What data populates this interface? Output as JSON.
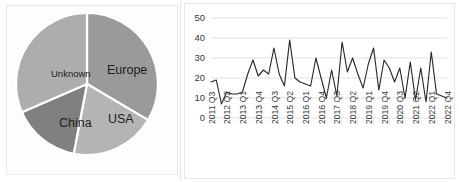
{
  "chart_data": [
    {
      "type": "pie",
      "title": "",
      "legend_position": "none",
      "labels": [
        "Europe",
        "USA",
        "China",
        "Unknown"
      ],
      "values": [
        33.5,
        19.5,
        15.5,
        31.5
      ],
      "colors": [
        "#9a9a9a",
        "#b4b4b4",
        "#808080",
        "#adadad"
      ],
      "start_angle_deg": 0,
      "direction": "clockwise",
      "slices": [
        {
          "label": "Europe",
          "value": 33.5,
          "color": "#9a9a9a",
          "start_deg": 0,
          "end_deg": 120.6
        },
        {
          "label": "USA",
          "value": 19.5,
          "color": "#b4b4b4",
          "start_deg": 120.6,
          "end_deg": 190.8
        },
        {
          "label": "China",
          "value": 15.5,
          "color": "#808080",
          "start_deg": 190.8,
          "end_deg": 246.6
        },
        {
          "label": "Unknown",
          "value": 31.5,
          "color": "#adadad",
          "start_deg": 246.6,
          "end_deg": 360
        }
      ]
    },
    {
      "type": "line",
      "title": "",
      "xlabel": "",
      "ylabel": "",
      "ylim": [
        0,
        50
      ],
      "yticks": [
        0,
        10,
        20,
        30,
        40,
        50
      ],
      "grid": true,
      "legend_position": "none",
      "line_color": "#2b2b2b",
      "x": [
        "2011 Q3",
        "2011 Q4",
        "2012 Q1",
        "2012 Q2",
        "2012 Q3",
        "2012 Q4",
        "2013 Q1",
        "2013 Q2",
        "2013 Q3",
        "2013 Q4",
        "2014 Q1",
        "2014 Q2",
        "2014 Q3",
        "2014 Q4",
        "2015 Q1",
        "2015 Q2",
        "2015 Q3",
        "2015 Q4",
        "2016 Q1",
        "2016 Q2",
        "2016 Q3",
        "2016 Q4",
        "2017 Q1",
        "2017 Q2",
        "2017 Q3",
        "2017 Q4",
        "2018 Q1",
        "2018 Q2",
        "2018 Q3",
        "2018 Q4",
        "2019 Q1",
        "2019 Q2",
        "2019 Q3",
        "2019 Q4",
        "2020 Q1",
        "2020 Q2",
        "2020 Q3",
        "2020 Q4",
        "2021 Q1",
        "2021 Q2",
        "2021 Q3",
        "2021 Q4",
        "2022 Q1",
        "2022 Q2",
        "2022 Q3",
        "2022 Q4"
      ],
      "xtick_labels": [
        "2011 Q3",
        "2012 Q2",
        "2013 Q1",
        "2013 Q4",
        "2014 Q3",
        "2015 Q2",
        "2016 Q1",
        "2016 Q4",
        "2017 Q3",
        "2018 Q2",
        "2019 Q1",
        "2019 Q4",
        "2020 Q3",
        "2021 Q2",
        "2022 Q1",
        "2022 Q4"
      ],
      "xtick_every": 3,
      "values": [
        18,
        19,
        7,
        13,
        12,
        12,
        13,
        22,
        29,
        21,
        24,
        22,
        35,
        22,
        16,
        39,
        20,
        18,
        17,
        16,
        30,
        20,
        10,
        24,
        11,
        38,
        23,
        30,
        22,
        15,
        27,
        35,
        14,
        29,
        25,
        18,
        25,
        10,
        28,
        9,
        25,
        8,
        33,
        12,
        11,
        10
      ]
    }
  ],
  "pie": {
    "labels": {
      "europe": "Europe",
      "usa": "USA",
      "china": "China",
      "unknown": "Unknown"
    }
  }
}
